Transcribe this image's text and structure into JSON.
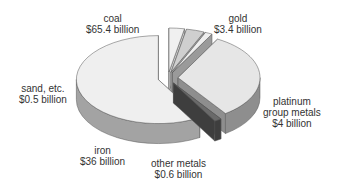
{
  "chart_data": {
    "type": "pie",
    "style": "3d-exploded",
    "title": "",
    "unit": "billion USD",
    "slices": [
      {
        "name": "gold",
        "value": 3.4,
        "label_lines": [
          "gold",
          "$3.4 billion"
        ],
        "top": "#f0f0f0",
        "side": "#c8c8c8"
      },
      {
        "name": "platinum group metals",
        "value": 4,
        "label_lines": [
          "platinum",
          "group metals",
          "$4 billion"
        ],
        "top": "#cfcfcf",
        "side": "#a9a9a9"
      },
      {
        "name": "other metals",
        "value": 0.6,
        "label_lines": [
          "other metals",
          "$0.6 billion"
        ],
        "top": "#eeeeee",
        "side": "#9a9a9a"
      },
      {
        "name": "iron",
        "value": 36,
        "label_lines": [
          "iron",
          "$36 billion"
        ],
        "top": "#e6e6e6",
        "side": "#8e8e8e"
      },
      {
        "name": "sand, etc.",
        "value": 0.5,
        "label_lines": [
          "sand, etc.",
          "$0.5 billion"
        ],
        "top": "#6a6a6a",
        "side": "#3e3e3e"
      },
      {
        "name": "coal",
        "value": 65.4,
        "label_lines": [
          "coal",
          "$65.4 billion"
        ],
        "top": "#efefef",
        "side": "#a3a3a3"
      }
    ],
    "legend": "none"
  }
}
